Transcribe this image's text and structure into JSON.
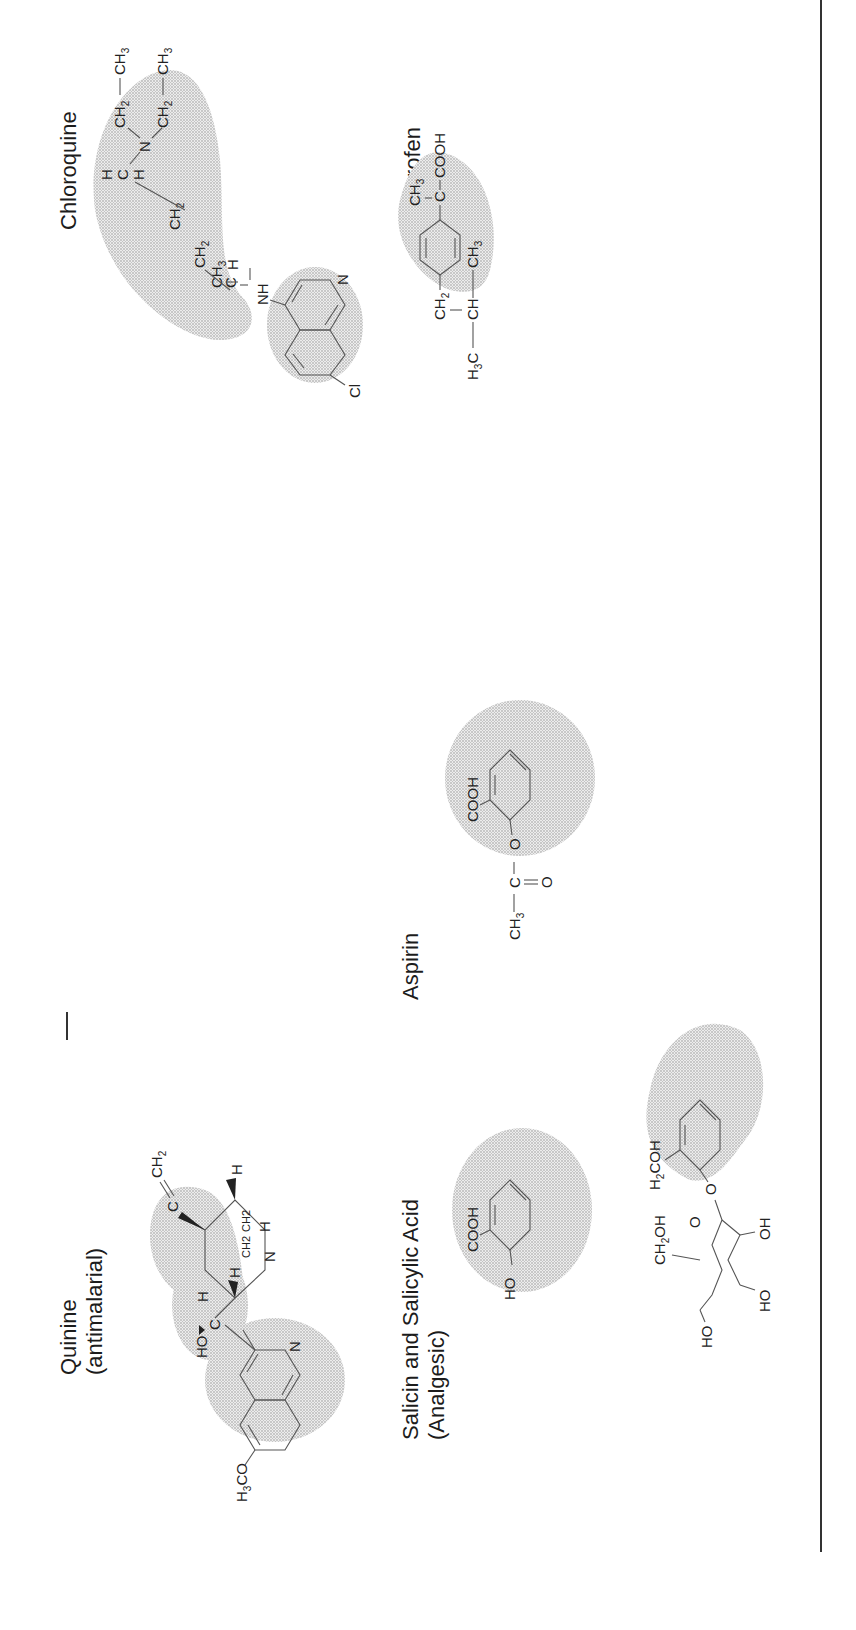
{
  "figure": {
    "orientation": "rotated-90-ccw",
    "rule_color": "#333333",
    "stipple_color": "#9a9a9a"
  },
  "compounds": [
    {
      "id": "quinine",
      "title": "Quinine",
      "subtitle": "(antimalarial)",
      "labels": {
        "h_top": "H",
        "c_vinyl": "C",
        "ch2_vinyl": "CH",
        "ch2_vinyl_sub": "2",
        "h_right": "H",
        "ch2_a": "CH2",
        "ch2_b": "CH2",
        "n_quin": "N",
        "h_c": "H",
        "c_center": "C",
        "h_left": "H",
        "ho": "HO",
        "n_ring": "N",
        "h3co": "H",
        "h3co_sub": "3",
        "h3co_rest": "CO"
      }
    },
    {
      "id": "salicin",
      "title": "Salicin and Salicylic Acid",
      "subtitle": "(Analgesic)",
      "labels": {
        "cooh": "COOH",
        "ho": "HO",
        "h2coh_h": "H",
        "h2coh_sub": "2",
        "h2coh_rest": "COH",
        "o_link": "O",
        "ch2oh_ch": "CH",
        "ch2oh_sub": "2",
        "ch2oh_rest": "OH",
        "o_ring": "O",
        "oh": "OH",
        "ho1": "HO",
        "ho2": "HO"
      }
    },
    {
      "id": "aspirin",
      "title": "Aspirin",
      "labels": {
        "cooh": "COOH",
        "o_ester": "O",
        "c": "C",
        "o_dbl": "O",
        "ch3": "CH",
        "ch3_sub": "3"
      }
    },
    {
      "id": "chloroquine",
      "title": "Chloroquine",
      "labels": {
        "h": "H",
        "c": "C",
        "ch3": "CH",
        "ch3_sub": "3",
        "nh": "NH",
        "n_ring": "N",
        "cl": "Cl",
        "ch2_1": "CH",
        "ch2_2": "CH",
        "sub2": "2",
        "hch_h1": "H",
        "hch_c": "C",
        "hch_h2": "H",
        "n_amine": "N",
        "ethyl_ch2": "CH",
        "ethyl_ch3": "CH",
        "sub3": "3"
      }
    },
    {
      "id": "ibuprofen",
      "title": "Ibuprofen",
      "labels": {
        "ch3_top": "CH",
        "c": "C",
        "cooh": "COOH",
        "ch2": "CH",
        "ch": "CH",
        "h3c": "H",
        "ch3_right": "CH",
        "sub2": "2",
        "sub3": "3"
      }
    }
  ]
}
